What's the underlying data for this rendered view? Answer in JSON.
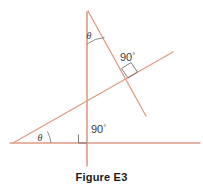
{
  "figure": {
    "caption": "Figure E3",
    "stroke_color": "#dd9c86",
    "marker_color": "#6e6e6e",
    "label_color": "#3a3a3a",
    "background": "#ffffff"
  },
  "labels": {
    "theta_top": "θ",
    "theta_bottom": "θ",
    "right_angle_upper": "90",
    "right_angle_upper_degree": "°",
    "right_angle_lower": "90",
    "right_angle_lower_degree": "°"
  },
  "geometry": {
    "type": "line-diagram",
    "lines": [
      {
        "name": "horizontal-baseline",
        "x1": 10,
        "y1": 143,
        "x2": 200,
        "y2": 143
      },
      {
        "name": "vertical-line",
        "x1": 87,
        "y1": 12,
        "x2": 87,
        "y2": 166
      },
      {
        "name": "transversal-line",
        "x1": 88,
        "y1": 11,
        "x2": 146,
        "y2": 116
      },
      {
        "name": "oblique-ray",
        "x1": 13,
        "y1": 143,
        "x2": 173,
        "y2": 52
      }
    ],
    "right_angle_markers": [
      {
        "name": "right-angle-transversal-oblique",
        "points": "128,78 122,69 131,63 137,72",
        "label_x": 122,
        "label_y": 60
      },
      {
        "name": "right-angle-vertical-baseline",
        "points": "79,135 79,143 87,143",
        "label_x": 91,
        "label_y": 133
      }
    ],
    "angle_arcs": [
      {
        "name": "theta-arc-top-vertex",
        "path": "M 87 43 A 32 32 0 0 1 104 36",
        "label_x": 90,
        "label_y": 38
      },
      {
        "name": "theta-arc-bottom-vertex",
        "path": "M 50 143 A 37 37 0 0 0 47 132",
        "label_x": 38,
        "label_y": 141
      }
    ]
  }
}
